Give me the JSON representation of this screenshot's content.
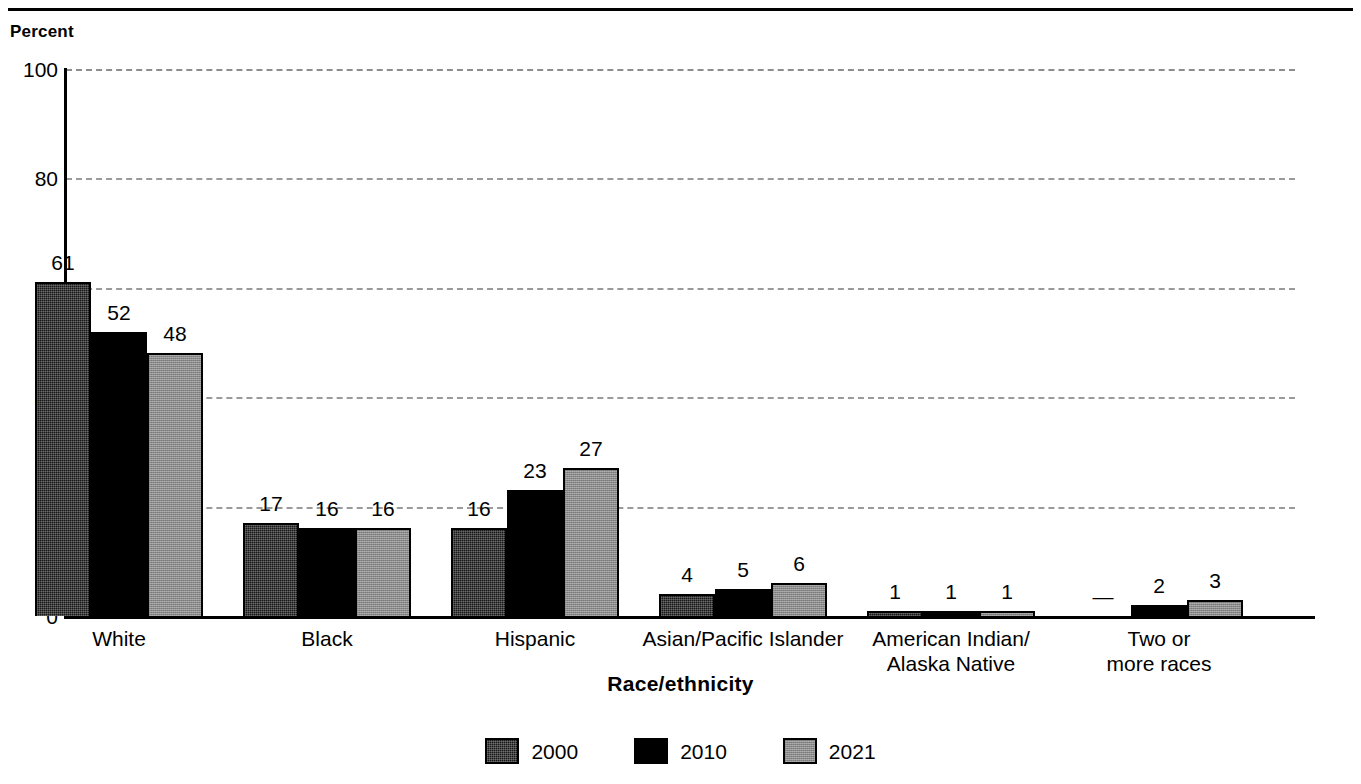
{
  "figure": {
    "percent_caption": "Percent",
    "axis_title": "Race/ethnicity"
  },
  "chart_data": {
    "type": "bar",
    "title": "",
    "xlabel": "Race/ethnicity",
    "ylabel": "Percent",
    "ylim": [
      0,
      100
    ],
    "yticks": [
      0,
      20,
      40,
      60,
      80,
      100
    ],
    "grid": true,
    "legend_position": "bottom",
    "categories": [
      "White",
      "Black",
      "Hispanic",
      "Asian/Pacific Islander",
      "American Indian/\nAlaska Native",
      "Two or\nmore races"
    ],
    "series": [
      {
        "name": "2000",
        "color": "#181818",
        "values": [
          61,
          17,
          16,
          4,
          1,
          null
        ],
        "labels": [
          "61",
          "17",
          "16",
          "4",
          "1",
          "—"
        ]
      },
      {
        "name": "2010",
        "color": "#000000",
        "values": [
          52,
          16,
          23,
          5,
          1,
          2
        ],
        "labels": [
          "52",
          "16",
          "23",
          "5",
          "1",
          "2"
        ]
      },
      {
        "name": "2021",
        "color": "#8a8a8a",
        "values": [
          48,
          16,
          27,
          6,
          1,
          3
        ],
        "labels": [
          "48",
          "16",
          "27",
          "6",
          "1",
          "3"
        ]
      }
    ]
  }
}
